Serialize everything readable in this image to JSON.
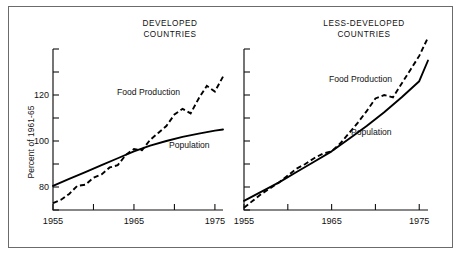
{
  "figure": {
    "y_axis_label": "Percent of 1961-65",
    "background_color": "#ffffff",
    "line_color": "#000000",
    "border_color": "#6b6b6b"
  },
  "panels": [
    {
      "id": "developed",
      "title": "DEVELOPED\nCOUNTRIES",
      "food_label": "Food Production",
      "population_label": "Population"
    },
    {
      "id": "less-developed",
      "title": "LESS-DEVELOPED\nCOUNTRIES",
      "food_label": "Food Production",
      "population_label": "Population"
    }
  ],
  "chart_data": {
    "type": "line",
    "xlabel": "",
    "ylabel": "Percent of 1961-65",
    "xlim": [
      1955,
      1976
    ],
    "ylim": [
      70,
      140
    ],
    "xticks": [
      1955,
      1960,
      1965,
      1970,
      1975
    ],
    "xtick_labels": [
      "1955",
      "",
      "1965",
      "",
      "1975"
    ],
    "yticks": [
      70,
      80,
      90,
      100,
      110,
      120,
      130,
      140
    ],
    "ytick_labels": [
      "",
      "80",
      "",
      "100",
      "",
      "120",
      "",
      ""
    ],
    "grid": false,
    "legend": "inline-annotations",
    "panels": [
      {
        "name": "DEVELOPED COUNTRIES",
        "series": [
          {
            "name": "Food Production",
            "style": "dashed",
            "x": [
              1955,
              1956,
              1957,
              1958,
              1959,
              1960,
              1961,
              1962,
              1963,
              1964,
              1965,
              1966,
              1967,
              1968,
              1969,
              1970,
              1971,
              1972,
              1973,
              1974,
              1975,
              1976
            ],
            "values": [
              73,
              74.5,
              77,
              80.5,
              81,
              84,
              85.5,
              88.5,
              89.5,
              94,
              96.5,
              96,
              100.5,
              103.5,
              106.5,
              111.5,
              114,
              112,
              118.5,
              124,
              121.5,
              128
            ]
          },
          {
            "name": "Population",
            "style": "solid",
            "x": [
              1955,
              1957,
              1959,
              1961,
              1963,
              1965,
              1967,
              1969,
              1971,
              1973,
              1975,
              1976
            ],
            "values": [
              80.5,
              83.5,
              86.5,
              89.5,
              92.5,
              95.5,
              98,
              100,
              101.8,
              103.2,
              104.5,
              105
            ]
          }
        ]
      },
      {
        "name": "LESS-DEVELOPED COUNTRIES",
        "series": [
          {
            "name": "Food Production",
            "style": "dashed",
            "x": [
              1955,
              1956,
              1957,
              1958,
              1959,
              1960,
              1961,
              1962,
              1963,
              1964,
              1965,
              1966,
              1967,
              1968,
              1969,
              1970,
              1971,
              1972,
              1973,
              1974,
              1975,
              1976
            ],
            "values": [
              71,
              74,
              77,
              79.5,
              82,
              85,
              88,
              90,
              92.5,
              94.5,
              95.5,
              99,
              103.5,
              108,
              113,
              118.5,
              120,
              119,
              125,
              131,
              137,
              145
            ]
          },
          {
            "name": "Population",
            "style": "solid",
            "x": [
              1955,
              1957,
              1959,
              1961,
              1963,
              1965,
              1967,
              1969,
              1971,
              1973,
              1975,
              1976
            ],
            "values": [
              74,
              78,
              82,
              86.5,
              91,
              95.5,
              101,
              106.5,
              112.5,
              119,
              126,
              135
            ]
          }
        ]
      }
    ]
  }
}
